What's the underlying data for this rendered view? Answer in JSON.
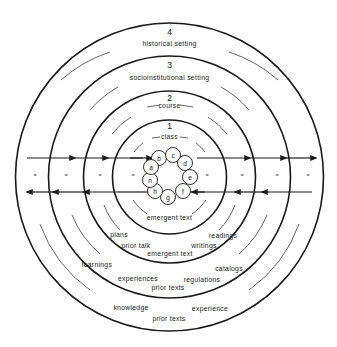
{
  "diagram": {
    "center": {
      "x": 169.5,
      "y": 177
    },
    "rings": [
      {
        "number": "1",
        "label": "class",
        "radius": 57
      },
      {
        "number": "2",
        "label": "course",
        "radius": 86
      },
      {
        "number": "3",
        "label": "socioinstitutional setting",
        "radius": 121
      },
      {
        "number": "4",
        "label": "historical setting",
        "radius": 154
      }
    ],
    "nodes": [
      {
        "id": "b",
        "x": 159,
        "y": 158
      },
      {
        "id": "c",
        "x": 173,
        "y": 155
      },
      {
        "id": "d",
        "x": 185,
        "y": 163
      },
      {
        "id": "e",
        "x": 190,
        "y": 177
      },
      {
        "id": "f",
        "x": 183,
        "y": 191
      },
      {
        "id": "g",
        "x": 168,
        "y": 197
      },
      {
        "id": "h",
        "x": 155,
        "y": 191
      },
      {
        "id": "n",
        "x": 150,
        "y": 180
      },
      {
        "id": "a",
        "x": 151,
        "y": 167
      }
    ],
    "node_radius": 7.5,
    "equals_marks": "=",
    "ring1_inner_label": "emergent text",
    "ring2_labels": {
      "left_top": "plans",
      "right_top": "readings",
      "left_mid": "prior talk",
      "right_mid": "writings",
      "bottom": "emergent text"
    },
    "ring3_labels": {
      "left_top": "learnings",
      "right_top": "catalogs",
      "left_mid": "experiences",
      "right_mid": "regulations",
      "bottom": "prior texts"
    },
    "ring4_labels": {
      "left": "knowledge",
      "right": "experience",
      "bottom": "prior texts"
    }
  }
}
